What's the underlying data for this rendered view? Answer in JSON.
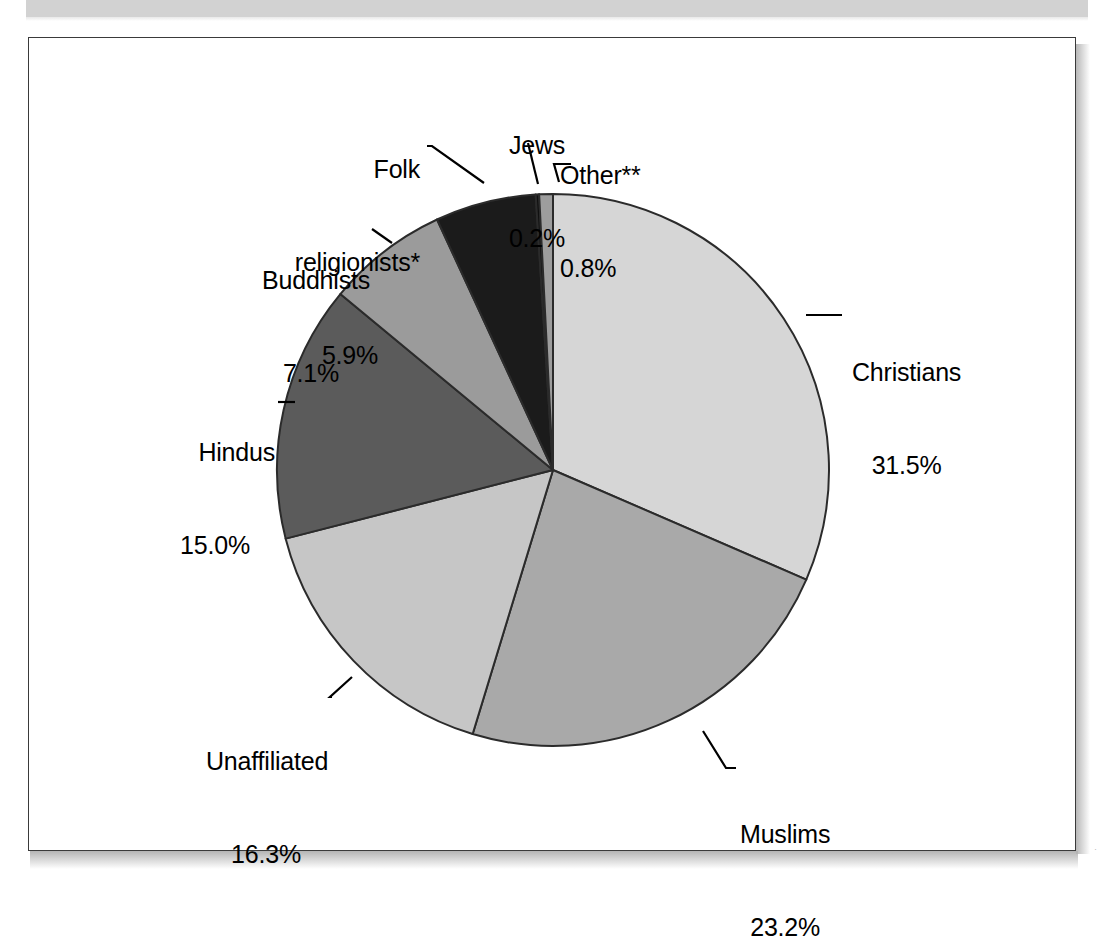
{
  "figure": {
    "frame_border_color": "#3a3a3a",
    "background": "#ffffff"
  },
  "chart_data": {
    "type": "pie",
    "title": "",
    "subtitle": "",
    "xlabel": "",
    "ylabel": "",
    "legend_position": "none",
    "grid": false,
    "total_percent": 100.0,
    "start_angle_deg": 0,
    "direction": "clockwise",
    "categories": [
      "Christians",
      "Muslims",
      "Unaffiliated",
      "Hindus",
      "Buddhists",
      "Folk religionists*",
      "Jews",
      "Other**"
    ],
    "values": [
      31.5,
      23.2,
      16.3,
      15.0,
      7.1,
      5.9,
      0.2,
      0.8
    ],
    "value_labels": [
      "31.5%",
      "23.2%",
      "16.3%",
      "15.0%",
      "7.1%",
      "5.9%",
      "0.2%",
      "0.8%"
    ],
    "colors": [
      "#d6d6d6",
      "#a9a9a9",
      "#c6c6c6",
      "#5b5b5b",
      "#9b9b9b",
      "#1b1b1b",
      "#101010",
      "#9d9d9d"
    ],
    "slice_border_color": "#2b2b2b",
    "slices": [
      {
        "name": "Christians",
        "percent": 31.5,
        "percent_label": "31.5%",
        "color": "#d6d6d6"
      },
      {
        "name": "Muslims",
        "percent": 23.2,
        "percent_label": "23.2%",
        "color": "#a9a9a9"
      },
      {
        "name": "Unaffiliated",
        "percent": 16.3,
        "percent_label": "16.3%",
        "color": "#c6c6c6"
      },
      {
        "name": "Hindus",
        "percent": 15.0,
        "percent_label": "15.0%",
        "color": "#5b5b5b"
      },
      {
        "name": "Buddhists",
        "percent": 7.1,
        "percent_label": "7.1%",
        "color": "#9b9b9b"
      },
      {
        "name": "Folk religionists*",
        "percent": 5.9,
        "percent_label": "5.9%",
        "color": "#1b1b1b"
      },
      {
        "name": "Jews",
        "percent": 0.2,
        "percent_label": "0.2%",
        "color": "#101010"
      },
      {
        "name": "Other**",
        "percent": 0.8,
        "percent_label": "0.8%",
        "color": "#9d9d9d"
      }
    ]
  },
  "labels": {
    "christians": {
      "name": "Christians",
      "percent": "31.5%"
    },
    "muslims": {
      "name": "Muslims",
      "percent": "23.2%"
    },
    "unaffiliated": {
      "name": "Unaffiliated",
      "percent": "16.3%"
    },
    "hindus": {
      "name": "Hindus",
      "percent": "15.0%"
    },
    "buddhists": {
      "name": "Buddhists",
      "percent": "7.1%"
    },
    "folk": {
      "name_line1": "Folk",
      "name_line2": "religionists*",
      "percent": "5.9%"
    },
    "jews": {
      "name": "Jews",
      "percent": "0.2%"
    },
    "other": {
      "name": "Other**",
      "percent": "0.8%"
    }
  },
  "artifacts": {
    "speck_right": "·",
    "speck_mid": "·"
  }
}
